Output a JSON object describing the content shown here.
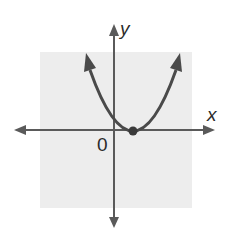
{
  "figure": {
    "type": "parabola-graph",
    "background_color": "#ffffff",
    "grid_region_color": "#ededed",
    "axis_color": "#5a5a5a",
    "curve_color": "#4a4a4a",
    "labels": {
      "x_axis": "x",
      "y_axis": "y",
      "origin": "0"
    },
    "curve": {
      "shape": "upward-opening parabola",
      "vertex_marker": "filled dot on positive x-axis",
      "ends": "arrows on both arms"
    }
  }
}
